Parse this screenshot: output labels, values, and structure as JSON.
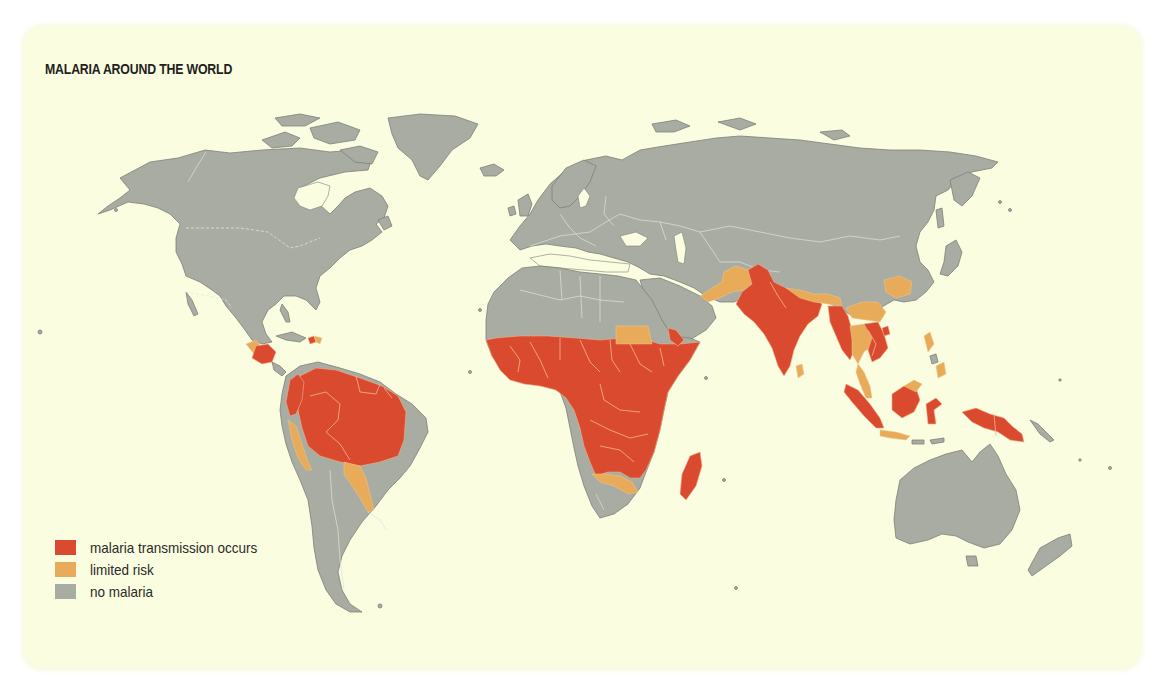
{
  "title": "MALARIA AROUND THE WORLD",
  "legend": {
    "items": [
      {
        "label": "malaria transmission occurs",
        "color": "#d94a2e",
        "key": "transmission"
      },
      {
        "label": "limited risk",
        "color": "#e8ab5a",
        "key": "limited"
      },
      {
        "label": "no malaria",
        "color": "#a9aca2",
        "key": "none"
      }
    ]
  },
  "colors": {
    "background": "#fbfde0",
    "page": "#ffffff",
    "transmission": "#d94a2e",
    "limited": "#e8ab5a",
    "none": "#a9aca2"
  },
  "regions": {
    "transmission": [
      "Central America",
      "Northern South America (Amazon basin)",
      "Sub-Saharan Africa",
      "Madagascar",
      "Yemen / SW Arabia",
      "India",
      "Pakistan",
      "Myanmar",
      "Cambodia / Vietnam",
      "Sumatra",
      "Borneo (south)",
      "Sulawesi",
      "New Guinea",
      "Hispaniola (Haiti)"
    ],
    "limited": [
      "Mexico (south)",
      "Peru coast",
      "Bolivia / Paraguay",
      "Sudan (north)",
      "Namibia / Botswana / S. Africa strip",
      "Afghanistan / Iran",
      "Nepal / Bhutan",
      "Thailand",
      "Southern China",
      "Central China spot",
      "Malay Peninsula",
      "Java / Lesser Sunda",
      "Philippines",
      "Sri Lanka",
      "Dominican Republic"
    ],
    "none": [
      "North America",
      "Greenland",
      "Europe",
      "Russia",
      "North Africa",
      "Middle East",
      "East Asia",
      "Japan",
      "Australia",
      "New Zealand",
      "Southern South America"
    ]
  }
}
